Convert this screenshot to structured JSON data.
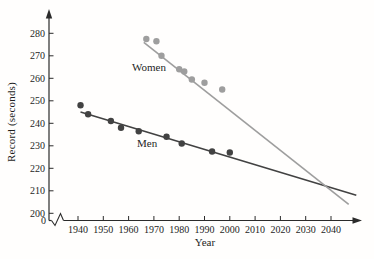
{
  "chart_data": {
    "type": "scatter",
    "title": "",
    "xlabel": "Year",
    "ylabel": "Record (seconds)",
    "x_ticks": [
      1940,
      1950,
      1960,
      1970,
      1980,
      1990,
      2000,
      2010,
      2020,
      2030,
      2040
    ],
    "y_ticks": [
      200,
      210,
      220,
      230,
      240,
      250,
      260,
      270,
      280
    ],
    "origin_label": "0",
    "axis_break_on_x": true,
    "axis_color": "#2b2b2b",
    "legend_position": "inline-labels",
    "series": [
      {
        "name": "Men",
        "color": "#424242",
        "points": [
          [
            1941,
            248
          ],
          [
            1944,
            244
          ],
          [
            1953,
            241
          ],
          [
            1957,
            238
          ],
          [
            1964,
            236.5
          ],
          [
            1975,
            234
          ],
          [
            1981,
            231
          ],
          [
            1993,
            227.5
          ],
          [
            2000,
            227
          ]
        ],
        "trend": {
          "x": [
            1941,
            2050
          ],
          "y": [
            245,
            208
          ]
        }
      },
      {
        "name": "Women",
        "color": "#9e9e9e",
        "points": [
          [
            1967,
            277.5
          ],
          [
            1971,
            276.5
          ],
          [
            1973,
            270
          ],
          [
            1980,
            264
          ],
          [
            1982,
            263
          ],
          [
            1985,
            259.5
          ],
          [
            1990,
            258
          ],
          [
            1997,
            255
          ]
        ],
        "trend": {
          "x": [
            1966,
            2047
          ],
          "y": [
            276,
            204
          ]
        }
      }
    ]
  }
}
